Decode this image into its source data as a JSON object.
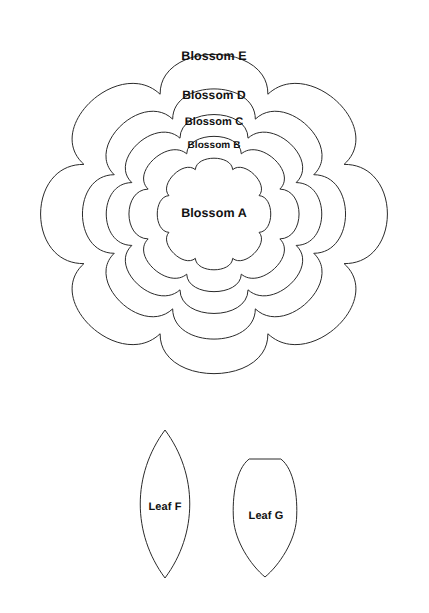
{
  "sheet": {
    "background_color": "#ffffff",
    "stroke_color": "#2a2a2a",
    "label_color": "#111111",
    "width": 429,
    "height": 613
  },
  "blossoms": [
    {
      "id": "blossom-e",
      "label": "Blossom E",
      "petal_count": 8,
      "center_x": 214,
      "center_y": 214,
      "outer_rx": 189,
      "outer_ry": 174,
      "inner_ratio": 0.745,
      "rotation": 22.5,
      "label_x": 214,
      "label_y": 56
    },
    {
      "id": "blossom-d",
      "label": "Blossom D",
      "petal_count": 8,
      "center_x": 214,
      "center_y": 214,
      "outer_rx": 143,
      "outer_ry": 136,
      "inner_ratio": 0.755,
      "rotation": 22.5,
      "label_x": 214,
      "label_y": 95
    },
    {
      "id": "blossom-c",
      "label": "Blossom C",
      "petal_count": 8,
      "center_x": 214,
      "center_y": 214,
      "outer_rx": 117,
      "outer_ry": 108,
      "inner_ratio": 0.76,
      "rotation": 22.5,
      "label_x": 214,
      "label_y": 122
    },
    {
      "id": "blossom-b",
      "label": "Blossom B",
      "petal_count": 8,
      "center_x": 214,
      "center_y": 214,
      "outer_rx": 92,
      "outer_ry": 84,
      "inner_ratio": 0.775,
      "rotation": 22.5,
      "label_x": 214,
      "label_y": 145
    },
    {
      "id": "blossom-a",
      "label": "Blossom A",
      "petal_count": 8,
      "center_x": 214,
      "center_y": 214,
      "outer_rx": 61,
      "outer_ry": 60,
      "inner_ratio": 0.8,
      "rotation": 22.5,
      "label_x": 214,
      "label_y": 213
    }
  ],
  "leaves": [
    {
      "id": "leaf-f",
      "label": "Leaf F",
      "shape": "pointed-oval",
      "left_x": 132,
      "right_x": 198,
      "top_y": 430,
      "bottom_y": 578,
      "label_x": 165,
      "label_y": 507
    },
    {
      "id": "leaf-g",
      "label": "Leaf G",
      "shape": "rounded-shield",
      "left_x": 232,
      "right_x": 298,
      "top_y": 457,
      "bottom_y": 577,
      "label_x": 266,
      "label_y": 516
    }
  ]
}
